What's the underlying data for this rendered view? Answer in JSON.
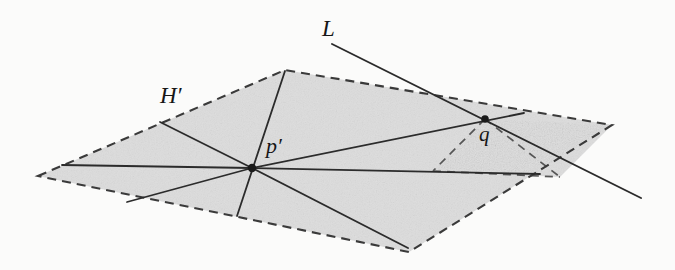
{
  "figure": {
    "background_color": "#fbfbfa",
    "plane_fill_color": "#dddddd",
    "stroke_color": "#2b2b2b",
    "labels": {
      "line_label": "L",
      "plane_label": "H′",
      "center_point_label": "p′",
      "intersection_point_label": "q"
    },
    "label_parts": {
      "plane_base": "H",
      "plane_prime": "′",
      "point_base": "p",
      "point_prime": "′"
    },
    "geometry": {
      "front_plane_vertices": "38,176 285,70 612,125 409,252",
      "back_plane_vertices": "485,119 612,125 560,177 433,171",
      "center_point": "252,168",
      "intersection_point": "485,119",
      "line_L_start": "332,44",
      "line_L_end": "641,198",
      "rays_from_center": [
        "62,165 252,168",
        "160,122 252,168",
        "285,71 252,168",
        "252,168 237,216",
        "252,168 408,248",
        "252,168 540,174",
        "252,168 524,113",
        "127,202 252,168"
      ]
    }
  }
}
